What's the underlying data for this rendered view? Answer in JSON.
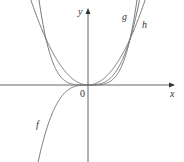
{
  "diagram": {
    "title": "",
    "axes": {
      "x_label": "x",
      "y_label": "y",
      "origin_label": "0",
      "color": "#555555"
    },
    "curves": [
      {
        "name": "f",
        "label": "f",
        "expression": "x^3",
        "color": "#777777"
      },
      {
        "name": "g",
        "label": "g",
        "expression": "x^4",
        "color": "#777777"
      },
      {
        "name": "h",
        "label": "h",
        "expression": "x^2",
        "color": "#777777"
      }
    ]
  },
  "chart_data": {
    "type": "line",
    "title": "",
    "xlabel": "x",
    "ylabel": "y",
    "grid": false,
    "series": [
      {
        "name": "f",
        "function": "x^3"
      },
      {
        "name": "g",
        "function": "x^4"
      },
      {
        "name": "h",
        "function": "x^2"
      }
    ],
    "annotations": [
      "0"
    ]
  }
}
